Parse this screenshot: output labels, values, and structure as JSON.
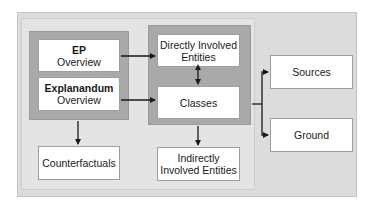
{
  "diagram": {
    "nodes": {
      "ep_overview": {
        "title": "EP",
        "subtitle": "Overview"
      },
      "explanandum_overview": {
        "title": "Explanandum",
        "subtitle": "Overview"
      },
      "directly_involved": {
        "line1": "Directly Involved",
        "line2": "Entities"
      },
      "classes": {
        "label": "Classes"
      },
      "counterfactuals": {
        "label": "Counterfactuals"
      },
      "indirectly_involved": {
        "line1": "Indirectly",
        "line2": "Involved Entities"
      },
      "sources": {
        "label": "Sources"
      },
      "ground": {
        "label": "Ground"
      }
    },
    "edges": [
      {
        "from": "EP Overview",
        "to": "Directly Involved Entities"
      },
      {
        "from": "Explanandum Overview",
        "to": "Classes"
      },
      {
        "from": "Directly Involved Entities",
        "to": "Classes",
        "bidirectional": true
      },
      {
        "from": "EP/Explanandum group",
        "to": "Counterfactuals"
      },
      {
        "from": "Entities/Classes group",
        "to": "Indirectly Involved Entities"
      },
      {
        "from": "Entities/Classes group",
        "to": "Sources"
      },
      {
        "from": "Entities/Classes group",
        "to": "Ground"
      }
    ],
    "colors": {
      "outer_panel": "#dcdcdc",
      "inner_panel": "#e4e4e4",
      "group_fill": "#a9a9a9",
      "box_fill": "#ffffff",
      "arrow": "#1a1a1a"
    }
  }
}
